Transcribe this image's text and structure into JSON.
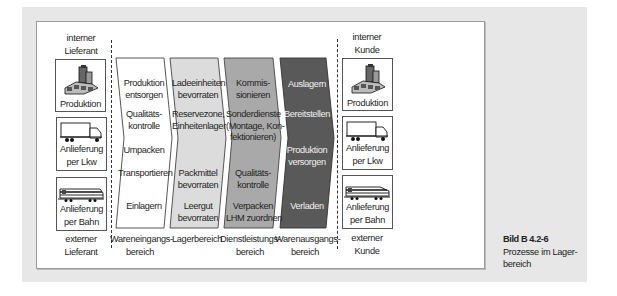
{
  "figure": {
    "caption_title": "Bild B 4.2-6",
    "caption_text_line1": "Prozesse im Lager-",
    "caption_text_line2": "bereich"
  },
  "left": {
    "top_label_line1": "interner",
    "top_label_line2": "Lieferant",
    "bottom_label_line1": "externer",
    "bottom_label_line2": "Lieferant",
    "boxes": [
      {
        "icon": "factory-icon",
        "line1": "Produktion",
        "line2": ""
      },
      {
        "icon": "truck-icon",
        "line1": "Anlieferung",
        "line2": "per Lkw"
      },
      {
        "icon": "train-icon",
        "line1": "Anlieferung",
        "line2": "per Bahn"
      }
    ]
  },
  "right": {
    "top_label_line1": "interner",
    "top_label_line2": "Kunde",
    "bottom_label_line1": "externer",
    "bottom_label_line2": "Kunde",
    "boxes": [
      {
        "icon": "factory-icon",
        "line1": "Produktion",
        "line2": ""
      },
      {
        "icon": "truck-icon",
        "line1": "Anlieferung",
        "line2": "per Lkw"
      },
      {
        "icon": "train-icon",
        "line1": "Anlieferung",
        "line2": "per Bahn"
      }
    ]
  },
  "stages": [
    {
      "fill": "#ffffff",
      "text_color": "#1e1e1e",
      "area_line1": "Wareneingangs-",
      "area_line2": "bereich",
      "items": [
        {
          "l1": "Produktion",
          "l2": "entsorgen"
        },
        {
          "l1": "Qualitäts-",
          "l2": "kontrolle"
        },
        {
          "l1": "Umpacken",
          "l2": ""
        },
        {
          "l1": "Transportieren",
          "l2": ""
        },
        {
          "l1": "Einlagern",
          "l2": ""
        }
      ]
    },
    {
      "fill": "#dcdcdc",
      "text_color": "#1e1e1e",
      "area_line1": "Lagerbereich",
      "area_line2": "",
      "items": [
        {
          "l1": "Ladeeinheiten",
          "l2": "bevorraten"
        },
        {
          "l1": "Reservezone,",
          "l2": "Einheitenlager"
        },
        {
          "l1": "Packmittel",
          "l2": "bevorraten"
        },
        {
          "l1": "Leergut",
          "l2": "bevorraten"
        }
      ]
    },
    {
      "fill": "#a9a9a9",
      "text_color": "#1e1e1e",
      "area_line1": "Dienstleistungs-",
      "area_line2": "bereich",
      "items": [
        {
          "l1": "Kommis-",
          "l2": "sionieren"
        },
        {
          "l1": "Sonderdienste",
          "l2": "(Montage, Kon-",
          "l3": "fektionieren)"
        },
        {
          "l1": "Qualitäts-",
          "l2": "kontrolle"
        },
        {
          "l1": "Verpacken",
          "l2": "LHM zuordnen"
        }
      ]
    },
    {
      "fill": "#595959",
      "text_color": "#f2f2f2",
      "area_line1": "Warenausgangs-",
      "area_line2": "bereich",
      "items": [
        {
          "l1": "Auslagern",
          "l2": ""
        },
        {
          "l1": "Bereitstellen",
          "l2": ""
        },
        {
          "l1": "Produktion",
          "l2": "versorgen"
        },
        {
          "l1": "Verladen",
          "l2": ""
        }
      ]
    }
  ]
}
